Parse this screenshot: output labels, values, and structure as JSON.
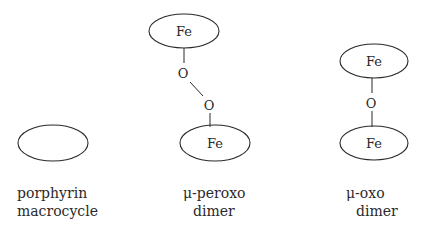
{
  "diagram": {
    "structures": [
      {
        "id": "porphyrin",
        "label_lines": [
          "porphyrin",
          "macrocycle"
        ],
        "atoms": []
      },
      {
        "id": "mu-peroxo",
        "label_lines": [
          "μ-peroxo",
          "dimer"
        ],
        "atoms": {
          "top_metal": "Fe",
          "oxygen1": "O",
          "oxygen2": "O",
          "bottom_metal": "Fe"
        }
      },
      {
        "id": "mu-oxo",
        "label_lines": [
          "μ-oxo",
          "dimer"
        ],
        "atoms": {
          "top_metal": "Fe",
          "oxygen": "O",
          "bottom_metal": "Fe"
        }
      }
    ]
  }
}
